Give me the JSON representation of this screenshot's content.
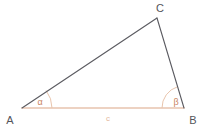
{
  "figure": {
    "type": "geometry-triangle-diagram",
    "background_color": "#ffffff",
    "vertex_labels": {
      "a": "A",
      "b": "B",
      "c": "C"
    },
    "angle_labels": {
      "alpha": "α",
      "beta": "β"
    },
    "side_labels": {
      "c": "c"
    },
    "colors": {
      "leg_stroke": "#5a5a60",
      "base_stroke": "#e8c4ae",
      "arc_stroke": "#e5bda3",
      "vertex_text": "#54545a",
      "angle_text": "#c9845f",
      "side_text": "#e3b79c"
    },
    "geometry": {
      "vertex_a": [
        22,
        108
      ],
      "vertex_b": [
        184,
        108
      ],
      "vertex_c": [
        157,
        18
      ],
      "alpha_arc_radius": 30,
      "beta_arc_radius": 22
    }
  }
}
